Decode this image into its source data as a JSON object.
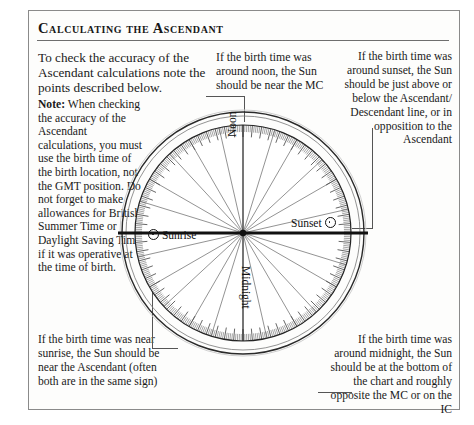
{
  "page": {
    "title": "Calculating the Ascendant",
    "background_color": "#ffffff",
    "frame_color": "#8a8a8a"
  },
  "text_blocks": {
    "intro": "To check the accuracy of the Ascendant calculations note the points described below.",
    "note_label": "Note:",
    "note_body": " When checking the accuracy of the Ascendant calculations, you must use the birth time of the birth loca­tion, not the GMT position. Do not forget to make allowances for British Summer Time or Day­light Saving Time if it was operative at the time of birth.",
    "noon_note": "If the birth time was around noon, the Sun should be near the MC",
    "sunset_note": "If the birth time was around sunset, the Sun should be just above or below the Ascendant/ Descendant line, or in opposition to the Ascendant",
    "sunrise_note": "If the birth time was near sunrise, the Sun should be near the Ascendant (often both are in the same sign)",
    "midnight_note": "If the birth time was around midnight, the Sun should be at the bottom of the chart and roughly opposite the MC or on the IC"
  },
  "diagram": {
    "name": "astrological-chart-wheel",
    "labels": {
      "noon": "Noon",
      "midnight": "Midnight",
      "sunrise": "Sunrise",
      "sunset": "Sunset"
    },
    "sun_symbol": "☉",
    "houses": 12,
    "degree_ticks": 360,
    "major_tick_every": 5,
    "axis_line": "Ascendant-Descendant (horizon)",
    "colors": {
      "line": "#111111",
      "tick": "#333333",
      "spoke": "#4a4a4a"
    }
  },
  "chart_data": {
    "type": "pie",
    "title": "Calculating the Ascendant",
    "categories": [
      "House 1",
      "House 2",
      "House 3",
      "House 4",
      "House 5",
      "House 6",
      "House 7",
      "House 8",
      "House 9",
      "House 10",
      "House 11",
      "House 12"
    ],
    "values": [
      30,
      30,
      30,
      30,
      30,
      30,
      30,
      30,
      30,
      30,
      30,
      30
    ],
    "annotations": [
      "Noon",
      "Sunset",
      "Midnight",
      "Sunrise"
    ],
    "xlabel": "",
    "ylabel": "",
    "legend": "none"
  }
}
